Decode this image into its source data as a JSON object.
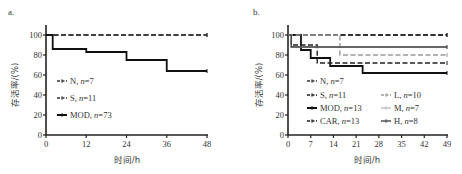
{
  "chart_data": [
    {
      "type": "line",
      "subtype": "kaplan-meier-step",
      "panel_label": "a.",
      "title": "",
      "xlabel": "时间/h",
      "ylabel": "存活率/(%)",
      "xlim": [
        0,
        48
      ],
      "ylim": [
        0,
        100
      ],
      "xticks": [
        0,
        12,
        24,
        36,
        48
      ],
      "yticks": [
        0,
        20,
        40,
        60,
        80,
        100
      ],
      "grid": false,
      "legend_position": "inside-lower-left",
      "series": [
        {
          "name": "N",
          "n": "7",
          "legend": "N, n=7",
          "style": "dashed",
          "color": "#333333",
          "x": [
            0,
            48
          ],
          "y": [
            100,
            100
          ]
        },
        {
          "name": "S",
          "n": "11",
          "legend": "S, n=11",
          "style": "dashed",
          "color": "#333333",
          "x": [
            0,
            48
          ],
          "y": [
            100,
            100
          ]
        },
        {
          "name": "MOD",
          "n": "73",
          "legend": "MOD, n=73",
          "style": "solid",
          "color": "#111111",
          "x": [
            0,
            2,
            12,
            24,
            36,
            48
          ],
          "y": [
            100,
            86,
            83,
            75,
            64,
            64
          ]
        }
      ]
    },
    {
      "type": "line",
      "subtype": "kaplan-meier-step",
      "panel_label": "b.",
      "title": "",
      "xlabel": "时间/h",
      "ylabel": "存活率/(%)",
      "xlim": [
        0,
        49
      ],
      "ylim": [
        0,
        100
      ],
      "xticks": [
        0,
        7,
        14,
        21,
        28,
        35,
        42,
        49
      ],
      "yticks": [
        0,
        20,
        40,
        60,
        80,
        100
      ],
      "grid": false,
      "legend_position": "inside-lower",
      "series": [
        {
          "name": "N",
          "n": "7",
          "legend": "N, n=7",
          "style": "dashed",
          "color": "#333333",
          "x": [
            0,
            49
          ],
          "y": [
            100,
            100
          ]
        },
        {
          "name": "S",
          "n": "11",
          "legend": "S, n=11",
          "style": "dashed",
          "color": "#222222",
          "x": [
            0,
            49
          ],
          "y": [
            100,
            100
          ]
        },
        {
          "name": "MOD",
          "n": "13",
          "legend": "MOD, n=13",
          "style": "solid",
          "color": "#111111",
          "x": [
            0,
            4,
            7,
            13,
            23,
            49
          ],
          "y": [
            100,
            85,
            77,
            69,
            62,
            62
          ]
        },
        {
          "name": "CAR",
          "n": "13",
          "legend": "CAR, n=13",
          "style": "dashed",
          "color": "#222222",
          "x": [
            0,
            1,
            9,
            49
          ],
          "y": [
            100,
            90,
            72,
            72
          ]
        },
        {
          "name": "L",
          "n": "10",
          "legend": "L, n=10",
          "style": "dashed",
          "color": "#9a9a9a",
          "x": [
            0,
            16,
            49
          ],
          "y": [
            100,
            80,
            80
          ]
        },
        {
          "name": "M",
          "n": "7",
          "legend": "M, n=7",
          "style": "solid",
          "color": "#bdbdbd",
          "x": [
            0,
            1,
            49
          ],
          "y": [
            100,
            88,
            88
          ]
        },
        {
          "name": "H",
          "n": "8",
          "legend": "H, n=8",
          "style": "solid",
          "color": "#444444",
          "x": [
            0,
            1,
            49
          ],
          "y": [
            100,
            88,
            88
          ]
        }
      ]
    }
  ],
  "panels": {
    "a": {
      "label": "a.",
      "xlabel": "时间/h",
      "ylabel": "存活率/(%)"
    },
    "b": {
      "label": "b.",
      "xlabel": "时间/h",
      "ylabel": "存活率/(%)"
    }
  }
}
